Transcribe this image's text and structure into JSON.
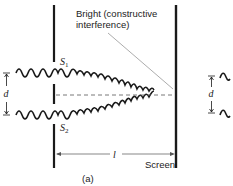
{
  "figure": {
    "caption": "(a)",
    "annotation": {
      "line1": "Bright (constructive",
      "line2": "interference)"
    },
    "labels": {
      "slit1": "S",
      "slit1_sub": "1",
      "slit2": "S",
      "slit2_sub": "2",
      "separation": "d",
      "distance": "l",
      "screen": "Screen",
      "separation_right": "d"
    },
    "colors": {
      "ink": "#1a1a1a",
      "leader": "#888888",
      "background": "#ffffff"
    }
  }
}
